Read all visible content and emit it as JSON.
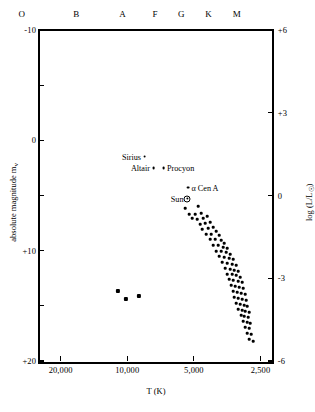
{
  "chart_data": {
    "type": "scatter",
    "title": "",
    "xlabel": "T (K)",
    "ylabel": "absolute magnitude m",
    "ylabel_sub": "v",
    "ylabel_right": "log (L/L",
    "ylabel_right_sub": "☉",
    "ylabel_right_end": ")",
    "xlim": [
      25000,
      2200
    ],
    "xscale": "log-reversed",
    "ylim": [
      -10,
      20
    ],
    "y2lim": [
      6,
      -6
    ],
    "grid": false,
    "legend": "none",
    "xticks": [
      {
        "label": "20,000",
        "value": 20000
      },
      {
        "label": "10,000",
        "value": 10000
      },
      {
        "label": "5,000",
        "value": 5000
      },
      {
        "label": "2,500",
        "value": 2500
      }
    ],
    "spectral_classes": [
      {
        "label": "O",
        "value": 30000
      },
      {
        "label": "B",
        "value": 17000
      },
      {
        "label": "A",
        "value": 10500
      },
      {
        "label": "F",
        "value": 7500
      },
      {
        "label": "G",
        "value": 5700
      },
      {
        "label": "K",
        "value": 4300
      },
      {
        "label": "M",
        "value": 3200
      }
    ],
    "yticks_left": [
      {
        "label": "-10",
        "value": -10
      },
      {
        "label": "",
        "value": -5
      },
      {
        "label": "0",
        "value": 0
      },
      {
        "label": "",
        "value": 5
      },
      {
        "label": "+10",
        "value": 10
      },
      {
        "label": "",
        "value": 15
      },
      {
        "label": "+20",
        "value": 20
      }
    ],
    "yticks_right": [
      {
        "label": "+6",
        "value": 6
      },
      {
        "label": "+3",
        "value": 3
      },
      {
        "label": "0",
        "value": 0
      },
      {
        "label": "-3",
        "value": -3
      },
      {
        "label": "-6",
        "value": -6
      }
    ],
    "named_stars": [
      {
        "name": "Sirius",
        "label": "Sirius",
        "side": "left",
        "px": 144.5,
        "py": 156.5
      },
      {
        "name": "Altair",
        "label": "Altair",
        "side": "left",
        "px": 153.5,
        "py": 168.0
      },
      {
        "name": "Procyon",
        "label": "Procyon",
        "side": "right",
        "px": 163.5,
        "py": 168.0
      },
      {
        "name": "alpha-cen-a",
        "label": "α Cen A",
        "side": "right",
        "px": 188.0,
        "py": 187.5
      },
      {
        "name": "Sun",
        "label": "Sun",
        "side": "left",
        "px": 187.0,
        "py": 198.5
      }
    ],
    "main_sequence_points": [
      [
        185,
        208
      ],
      [
        198,
        206
      ],
      [
        189,
        214
      ],
      [
        195,
        214
      ],
      [
        201,
        213
      ],
      [
        192,
        218
      ],
      [
        197,
        219
      ],
      [
        203,
        218
      ],
      [
        207,
        216
      ],
      [
        200,
        224
      ],
      [
        205,
        223
      ],
      [
        210,
        222
      ],
      [
        202,
        229
      ],
      [
        208,
        228
      ],
      [
        213,
        227
      ],
      [
        216,
        231
      ],
      [
        206,
        234
      ],
      [
        211,
        234
      ],
      [
        219,
        235
      ],
      [
        210,
        239
      ],
      [
        215,
        239
      ],
      [
        221,
        240
      ],
      [
        224,
        243
      ],
      [
        213,
        245
      ],
      [
        218,
        245
      ],
      [
        223,
        247
      ],
      [
        227,
        248
      ],
      [
        216,
        251
      ],
      [
        221,
        251
      ],
      [
        226,
        252
      ],
      [
        230,
        254
      ],
      [
        219,
        256
      ],
      [
        224,
        257
      ],
      [
        229,
        258
      ],
      [
        233,
        259
      ],
      [
        222,
        262
      ],
      [
        227,
        263
      ],
      [
        232,
        264
      ],
      [
        236,
        265
      ],
      [
        225,
        268
      ],
      [
        230,
        269
      ],
      [
        234,
        270
      ],
      [
        238,
        271
      ],
      [
        227,
        274
      ],
      [
        232,
        274
      ],
      [
        236,
        275
      ],
      [
        240,
        277
      ],
      [
        229,
        279
      ],
      [
        233,
        280
      ],
      [
        238,
        281
      ],
      [
        242,
        282
      ],
      [
        231,
        285
      ],
      [
        235,
        286
      ],
      [
        239,
        287
      ],
      [
        243,
        288
      ],
      [
        233,
        291
      ],
      [
        237,
        292
      ],
      [
        241,
        293
      ],
      [
        245,
        294
      ],
      [
        234,
        297
      ],
      [
        238,
        298
      ],
      [
        242,
        299
      ],
      [
        246,
        300
      ],
      [
        236,
        303
      ],
      [
        240,
        304
      ],
      [
        244,
        305
      ],
      [
        247,
        306
      ],
      [
        238,
        309
      ],
      [
        242,
        310
      ],
      [
        245,
        311
      ],
      [
        249,
        312
      ],
      [
        241,
        315
      ],
      [
        244,
        316
      ],
      [
        248,
        317
      ],
      [
        243,
        321
      ],
      [
        247,
        322
      ],
      [
        250,
        323
      ],
      [
        245,
        327
      ],
      [
        249,
        328
      ],
      [
        247,
        333
      ],
      [
        251,
        334
      ],
      [
        249,
        339
      ],
      [
        253,
        341
      ]
    ],
    "white_dwarf_points": [
      [
        118,
        291
      ],
      [
        126,
        299
      ],
      [
        139,
        296
      ]
    ]
  }
}
